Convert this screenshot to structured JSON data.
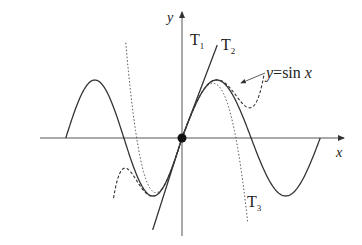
{
  "diagram": {
    "axes": {
      "x_label": "x",
      "y_label": "y"
    },
    "curves": [
      {
        "id": "sin",
        "label_main": "y",
        "label_eq": "=sin ",
        "label_var": "x",
        "style": "solid"
      },
      {
        "id": "T1",
        "label_main": "T",
        "label_sub": "1",
        "style": "solid",
        "description": "y = x"
      },
      {
        "id": "T2",
        "label_main": "T",
        "label_sub": "2",
        "style": "dotted",
        "description": "y = x - x^3/6"
      },
      {
        "id": "T3",
        "label_main": "T",
        "label_sub": "3",
        "style": "dashed",
        "description": "y = x - x^3/6 + x^5/120"
      }
    ],
    "point": {
      "label": "origin",
      "description": "point of tangency at (0,0)"
    },
    "colors": {
      "stroke": "#333333",
      "background": "#ffffff"
    }
  }
}
